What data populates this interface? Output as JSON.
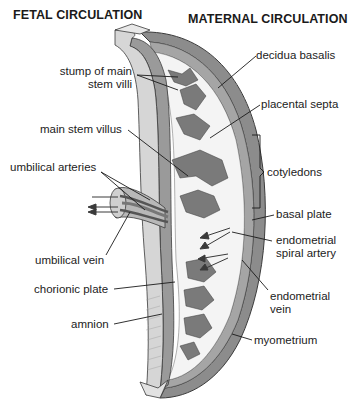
{
  "headings": {
    "left": "FETAL CIRCULATION",
    "right": "MATERNAL CIRCULATION"
  },
  "labels": {
    "stump_line1": "stump of main",
    "stump_line2": "stem villi",
    "main_stem_villus": "main stem villus",
    "umbilical_arteries": "umbilical arteries",
    "umbilical_vein": "umbilical vein",
    "chorionic_plate": "chorionic plate",
    "amnion": "amnion",
    "decidua_basalis": "decidua basalis",
    "placental_septa": "placental septa",
    "cotyledons": "cotyledons",
    "basal_plate": "basal plate",
    "spiral_artery_line1": "endometrial",
    "spiral_artery_line2": "spiral artery",
    "vein_line1": "endometrial",
    "vein_line2": "vein",
    "myometrium": "myometrium"
  },
  "colors": {
    "amnion_fill": "#d4d4d4",
    "chorion_fill": "#a9a9a9",
    "villi_fill": "#7b7b7b",
    "myometrium_fill": "#8a8a8a",
    "intervillous_space": "#f4f4f4",
    "outline": "#3a3a3a",
    "text": "#222222"
  }
}
